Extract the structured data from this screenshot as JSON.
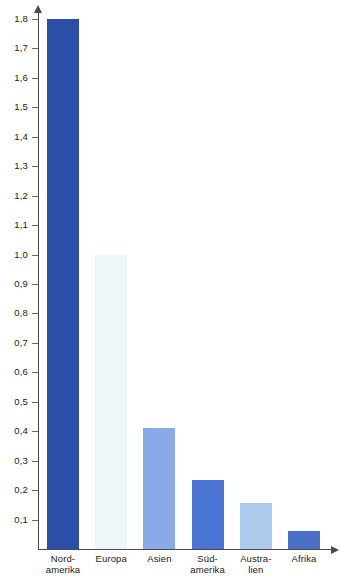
{
  "chart_data": {
    "type": "bar",
    "title": "",
    "subtitle": "",
    "xlabel": "",
    "ylabel": "",
    "categories": [
      "Nord-amerika",
      "Europa",
      "Asien",
      "Süd-amerika",
      "Austra-lien",
      "Afrika"
    ],
    "values": [
      1.8,
      1.0,
      0.41,
      0.235,
      0.155,
      0.06
    ],
    "ylim": [
      0,
      1.85
    ],
    "grid": false,
    "legend": null,
    "decimal_separator": ",",
    "y_ticks": [
      {
        "value": 1.8,
        "label": "1,8"
      },
      {
        "value": 1.7,
        "label": "1,7"
      },
      {
        "value": 1.6,
        "label": "1,6"
      },
      {
        "value": 1.5,
        "label": "1,5"
      },
      {
        "value": 1.4,
        "label": "1,4"
      },
      {
        "value": 1.3,
        "label": "1,3"
      },
      {
        "value": 1.2,
        "label": "1,2"
      },
      {
        "value": 1.1,
        "label": "1,1"
      },
      {
        "value": 1.0,
        "label": "1,0"
      },
      {
        "value": 0.9,
        "label": "0,9"
      },
      {
        "value": 0.8,
        "label": "0,8"
      },
      {
        "value": 0.7,
        "label": "0,7"
      },
      {
        "value": 0.6,
        "label": "0,6"
      },
      {
        "value": 0.5,
        "label": "0,5"
      },
      {
        "value": 0.4,
        "label": "0,4"
      },
      {
        "value": 0.3,
        "label": "0,3"
      },
      {
        "value": 0.2,
        "label": "0,2"
      },
      {
        "value": 0.1,
        "label": "0,1"
      }
    ],
    "bars": [
      {
        "category": "Nordamerika",
        "line1": "Nord-",
        "line2": "amerika",
        "value": 1.8,
        "color": "#2B4FA8"
      },
      {
        "category": "Europa",
        "line1": "Europa",
        "line2": "",
        "value": 1.0,
        "color": "#EDF6F8"
      },
      {
        "category": "Asien",
        "line1": "Asien",
        "line2": "",
        "value": 0.41,
        "color": "#8AA9E8"
      },
      {
        "category": "Südamerika",
        "line1": "Süd-",
        "line2": "amerika",
        "value": 0.235,
        "color": "#4A74D4"
      },
      {
        "category": "Australien",
        "line1": "Austra-",
        "line2": "lien",
        "value": 0.155,
        "color": "#AFC9EC"
      },
      {
        "category": "Afrika",
        "line1": "Afrika",
        "line2": "",
        "value": 0.06,
        "color": "#4A6FC8"
      }
    ]
  },
  "axes": {
    "y_axis_name": "y-axis",
    "x_axis_name": "x-axis"
  }
}
